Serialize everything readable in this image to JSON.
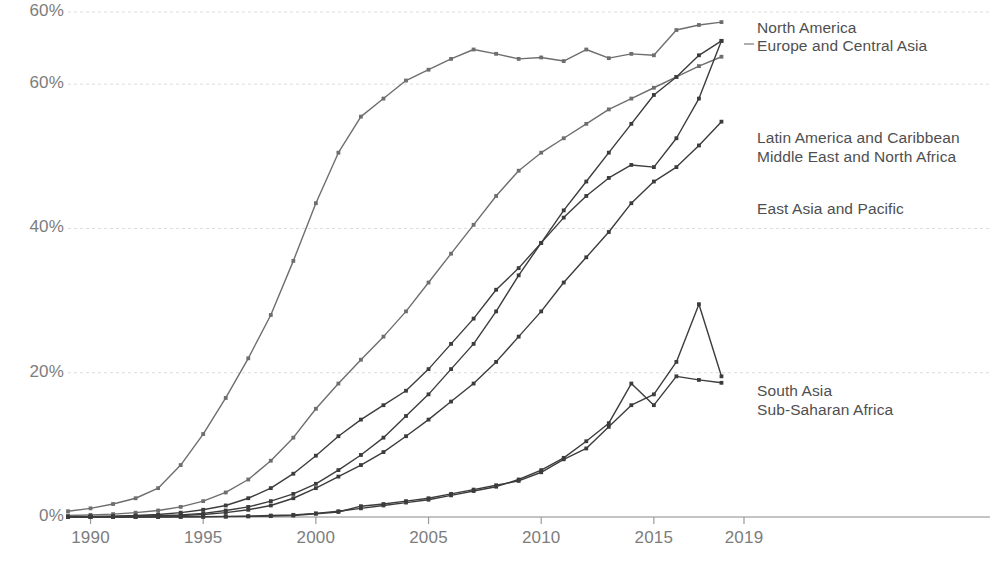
{
  "chart_data": {
    "type": "line",
    "title": "",
    "subtitle": "",
    "xlabel": "",
    "ylabel": "",
    "xlim": [
      1989,
      2019
    ],
    "ylim": [
      0,
      70
    ],
    "grid": true,
    "legend_position": "right-inline-labels",
    "x": [
      1989,
      1990,
      1991,
      1992,
      1993,
      1994,
      1995,
      1996,
      1997,
      1998,
      1999,
      2000,
      2001,
      2002,
      2003,
      2004,
      2005,
      2006,
      2007,
      2008,
      2009,
      2010,
      2011,
      2012,
      2013,
      2014,
      2015,
      2016,
      2017,
      2018
    ],
    "x_ticks": [
      1990,
      1995,
      2000,
      2005,
      2010,
      2015,
      2019
    ],
    "x_tick_labels": [
      "1990",
      "1995",
      "2000",
      "2005",
      "2010",
      "2015",
      "2019"
    ],
    "y_ticks": [
      0,
      20,
      40,
      60,
      70
    ],
    "y_tick_labels": [
      "0%",
      "20%",
      "40%",
      "60%",
      "60%"
    ],
    "series": [
      {
        "name": "North America",
        "color": "#6e6e6e",
        "values": [
          0.8,
          1.2,
          1.8,
          2.6,
          4.0,
          7.2,
          11.5,
          16.5,
          22.0,
          28.0,
          35.5,
          43.5,
          50.5,
          55.5,
          58.0,
          60.5,
          62.0,
          63.5,
          64.8,
          64.2,
          63.5,
          63.7,
          63.2,
          64.8,
          63.6,
          64.2,
          64.0,
          67.5,
          68.2,
          68.6
        ]
      },
      {
        "name": "Europe and Central Asia",
        "color": "#6e6e6e",
        "values": [
          0.2,
          0.3,
          0.4,
          0.6,
          0.9,
          1.4,
          2.2,
          3.4,
          5.2,
          7.8,
          11.0,
          15.0,
          18.5,
          21.8,
          25.0,
          28.5,
          32.5,
          36.5,
          40.5,
          44.5,
          48.0,
          50.5,
          52.5,
          54.5,
          56.5,
          58.0,
          59.5,
          61.0,
          62.5,
          63.8
        ]
      },
      {
        "name": "Latin America and Caribbean",
        "color": "#3c3c3c",
        "values": [
          0.05,
          0.08,
          0.12,
          0.2,
          0.35,
          0.6,
          1.0,
          1.6,
          2.6,
          4.0,
          6.0,
          8.5,
          11.2,
          13.5,
          15.5,
          17.5,
          20.5,
          24.0,
          27.5,
          31.5,
          34.5,
          38.0,
          42.5,
          46.5,
          50.5,
          54.5,
          58.5,
          61.0,
          64.0,
          66.0
        ]
      },
      {
        "name": "Middle East and North Africa",
        "color": "#3c3c3c",
        "values": [
          0.02,
          0.04,
          0.06,
          0.1,
          0.18,
          0.3,
          0.5,
          0.9,
          1.4,
          2.2,
          3.2,
          4.6,
          6.5,
          8.6,
          11.0,
          14.0,
          17.0,
          20.5,
          24.0,
          28.5,
          33.5,
          38.0,
          41.5,
          44.5,
          47.0,
          48.8,
          48.5,
          52.5,
          58.0,
          66.0
        ]
      },
      {
        "name": "East Asia and Pacific",
        "color": "#3c3c3c",
        "values": [
          0.02,
          0.03,
          0.05,
          0.08,
          0.12,
          0.2,
          0.35,
          0.6,
          1.0,
          1.6,
          2.6,
          4.0,
          5.6,
          7.2,
          9.0,
          11.2,
          13.5,
          16.0,
          18.5,
          21.5,
          25.0,
          28.5,
          32.5,
          36.0,
          39.5,
          43.5,
          46.5,
          48.5,
          51.5,
          54.8
        ]
      },
      {
        "name": "South Asia",
        "color": "#3c3c3c",
        "values": [
          0.0,
          0.0,
          0.0,
          0.0,
          0.01,
          0.02,
          0.03,
          0.05,
          0.08,
          0.12,
          0.2,
          0.45,
          0.7,
          1.5,
          1.8,
          2.2,
          2.6,
          3.2,
          3.8,
          4.4,
          5.0,
          6.2,
          8.0,
          9.5,
          12.5,
          15.5,
          17.0,
          21.5,
          29.5,
          19.5
        ]
      },
      {
        "name": "Sub-Saharan Africa",
        "color": "#3c3c3c",
        "values": [
          0.0,
          0.0,
          0.0,
          0.01,
          0.02,
          0.03,
          0.05,
          0.08,
          0.12,
          0.2,
          0.3,
          0.5,
          0.8,
          1.2,
          1.6,
          2.0,
          2.4,
          3.0,
          3.6,
          4.2,
          5.2,
          6.5,
          8.2,
          10.5,
          13.0,
          18.5,
          15.5,
          19.5,
          19.0,
          18.6
        ]
      }
    ],
    "annotations": [
      {
        "text": "North America",
        "x_px": 757,
        "y_px": 18,
        "leader": false
      },
      {
        "text": "Europe and Central Asia",
        "x_px": 757,
        "y_px": 36,
        "leader": true,
        "leader_from_x": 744,
        "leader_from_y": 44
      },
      {
        "text": "Latin America and Caribbean",
        "x_px": 757,
        "y_px": 128,
        "leader": false
      },
      {
        "text": "Middle East and North Africa",
        "x_px": 757,
        "y_px": 147,
        "leader": false
      },
      {
        "text": "East Asia and Pacific",
        "x_px": 757,
        "y_px": 199,
        "leader": false
      },
      {
        "text": "South Asia",
        "x_px": 757,
        "y_px": 381,
        "leader": false
      },
      {
        "text": "Sub-Saharan Africa",
        "x_px": 757,
        "y_px": 400,
        "leader": false
      }
    ]
  },
  "axes": {
    "y_label_color": "#7d7d7d",
    "x_label_color": "#7d7d7d",
    "gridline_color": "#dcdcdc",
    "axis_line_color": "#9a9a9a"
  }
}
